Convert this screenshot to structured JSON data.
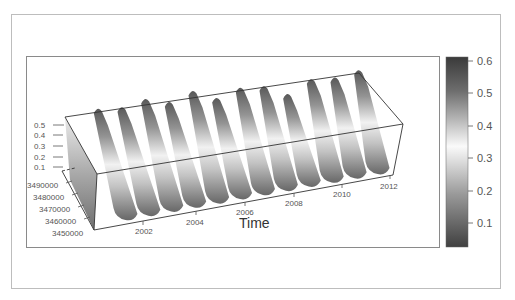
{
  "chart_data": {
    "type": "surface3d",
    "title": "",
    "xlabel": "Time",
    "ylabel": "",
    "zlabel": "",
    "x_ticks": [
      "2002",
      "2004",
      "2006",
      "2008",
      "2010",
      "2012"
    ],
    "y_ticks": [
      "3490000",
      "3480000",
      "3470000",
      "3460000",
      "3450000"
    ],
    "z_ticks": [
      "0.5",
      "0.4",
      "0.3",
      "0.2",
      "0.1"
    ],
    "x_range": [
      2000.5,
      2012.3
    ],
    "y_range": [
      3450000,
      3490000
    ],
    "z_range": [
      0.05,
      0.55
    ],
    "colorbar": {
      "ticks": [
        "0.6",
        "0.5",
        "0.4",
        "0.3",
        "0.2",
        "0.1"
      ],
      "range": [
        0.03,
        0.62
      ],
      "colormap": "grayscale diverging (dark at extremes, light near 0.33)"
    },
    "series": [
      {
        "name": "seasonal peaks (approx. max value per year)",
        "x": [
          2001,
          2002,
          2003,
          2004,
          2005,
          2006,
          2007,
          2008,
          2009,
          2010,
          2011,
          2012
        ],
        "values": [
          0.52,
          0.5,
          0.55,
          0.48,
          0.56,
          0.45,
          0.52,
          0.5,
          0.38,
          0.5,
          0.48,
          0.52
        ]
      }
    ],
    "grid": false,
    "legend_position": "right (colorbar)"
  },
  "colors": {
    "frame": "#bdbdbd",
    "panel_border": "#8a8a8a",
    "box_line": "#333333",
    "dark": "#3a3a3a",
    "light": "#f4f4f4"
  }
}
